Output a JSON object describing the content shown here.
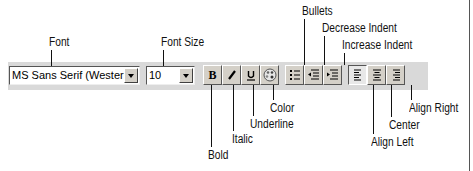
{
  "toolbar": {
    "font": {
      "label": "Font",
      "value": "MS Sans Serif (Western)"
    },
    "font_size": {
      "label": "Font Size",
      "value": "10"
    },
    "buttons": {
      "bold": {
        "glyph": "B",
        "label": "Bold"
      },
      "italic": {
        "glyph": "I",
        "label": "Italic"
      },
      "underline": {
        "glyph": "U",
        "label": "Underline"
      },
      "color": {
        "label": "Color",
        "icon": "palette-icon"
      },
      "bullets": {
        "label": "Bullets",
        "icon": "bullet-list-icon"
      },
      "decrease_indent": {
        "label": "Decrease Indent",
        "icon": "outdent-icon"
      },
      "increase_indent": {
        "label": "Increase Indent",
        "icon": "indent-icon"
      },
      "align_left": {
        "label": "Align Left",
        "icon": "align-left-icon",
        "pressed": true
      },
      "center": {
        "label": "Center",
        "icon": "align-center-icon"
      },
      "align_right": {
        "label": "Align Right",
        "icon": "align-right-icon"
      }
    }
  }
}
